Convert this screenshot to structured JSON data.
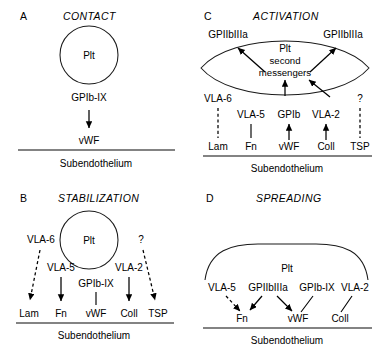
{
  "figure": {
    "type": "scientific-diagram",
    "substrate_label": "Subendothelium",
    "platelet_label": "Plt",
    "colors": {
      "ink": "#000000",
      "outline": "#1a1a1a",
      "baseline": "#5a5a5a",
      "background": "#ffffff"
    }
  },
  "panels": {
    "a": {
      "letter": "A",
      "title": "CONTACT",
      "cell_label": "Plt",
      "receptor": "GPIb-IX",
      "ligand": "vWF",
      "substrate": "Subendothelium"
    },
    "b": {
      "letter": "B",
      "title": "STABILIZATION",
      "cell_label": "Plt",
      "receptors": [
        "VLA-6",
        "VLA-5",
        "GPIb-IX",
        "VLA-2",
        "?"
      ],
      "ligands": [
        "Lam",
        "Fn",
        "vWF",
        "Coll",
        "TSP"
      ],
      "substrate": "Subendothelium"
    },
    "c": {
      "letter": "C",
      "title": "ACTIVATION",
      "cell_label": "Plt",
      "inner_text_line2": "second",
      "inner_text_line3": "messengers",
      "integrin_left": "GPIIbIIIa",
      "integrin_right": "GPIIbIIIa",
      "receptors": [
        "VLA-6",
        "VLA-5",
        "GPIb",
        "VLA-2",
        "?"
      ],
      "ligands": [
        "Lam",
        "Fn",
        "vWF",
        "Coll",
        "TSP"
      ],
      "substrate": "Subendothelium"
    },
    "d": {
      "letter": "D",
      "title": "SPREADING",
      "cell_label": "Plt",
      "receptors": [
        "VLA-5",
        "GPIIbIIIa",
        "GPIb-IX",
        "VLA-2"
      ],
      "ligands": [
        "Fn",
        "vWF",
        "Coll"
      ],
      "substrate": "Subendothelium"
    }
  }
}
